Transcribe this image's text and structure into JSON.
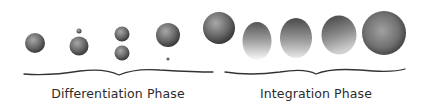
{
  "phases": [
    {
      "label": "Differentiation Phase",
      "center_x": 118
    },
    {
      "label": "Integration Phase",
      "center_x": 316
    }
  ],
  "colors": {
    "sphere_dark": "#3e3e3e",
    "sphere_light": "#9a9a9a",
    "brace": "#333333",
    "text": "#2b2b2b"
  }
}
